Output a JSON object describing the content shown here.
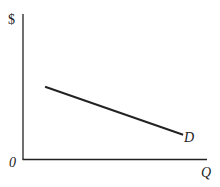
{
  "diagram": {
    "type": "demand-curve",
    "y_axis_label": "$",
    "x_axis_label": "Q",
    "origin_label": "0",
    "curve_label": "D",
    "curve": {
      "name": "Demand",
      "slope": "negative",
      "start": {
        "q": 0.12,
        "p": 0.5
      },
      "end": {
        "q": 0.87,
        "p": 0.17
      }
    },
    "colors": {
      "line": "#222222",
      "axis": "#222222"
    }
  }
}
